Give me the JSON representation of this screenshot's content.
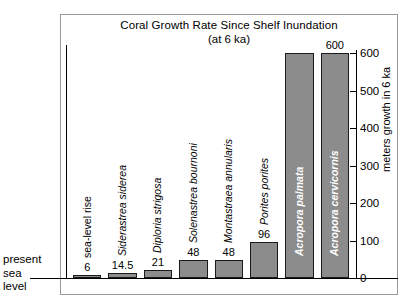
{
  "chart_data": {
    "type": "bar",
    "title": "Coral Growth Rate Since Shelf Inundation",
    "subtitle": "(at 6 ka)",
    "xlabel": "",
    "ylabel": "meters growth in 6 ka",
    "ylim": [
      0,
      600
    ],
    "yticks": [
      0,
      100,
      200,
      300,
      400,
      500,
      600
    ],
    "grid": false,
    "legend": null,
    "categories": [
      "sea-level rise",
      "Siderastrea siderea",
      "Diploria strigosa",
      "Solenastrea bournoni",
      "Montastraea annularis",
      "Porites porites",
      "Acropora palmata",
      "Acropora cervicornis"
    ],
    "values": [
      6,
      14.5,
      21,
      48,
      48,
      96,
      600,
      600
    ],
    "value_labels": [
      "6",
      "14.5",
      "21",
      "48",
      "48",
      "96",
      "",
      "600"
    ],
    "annotations": [
      "present sea level"
    ]
  },
  "chart": {
    "title": "Coral Growth Rate Since Shelf Inundation",
    "subtitle": "(at 6 ka)",
    "y_axis_title": "meters growth in 6 ka",
    "sea_level_annotation": "present\nsea\nlevel",
    "bar_fill_color": "#8c8c8c",
    "bar_stroke_color": "#1a1a1a",
    "frame_color": "#9a9a9a",
    "axis_color": "#000000",
    "inside_label_color": "#ffffff"
  },
  "bars": [
    {
      "label": "sea-level rise",
      "value": 6,
      "value_label": "6",
      "italic": false,
      "label_inside": false
    },
    {
      "label": "Siderastrea siderea",
      "value": 14.5,
      "value_label": "14.5",
      "italic": true,
      "label_inside": false
    },
    {
      "label": "Diploria strigosa",
      "value": 21,
      "value_label": "21",
      "italic": true,
      "label_inside": false
    },
    {
      "label": "Solenastrea bournoni",
      "value": 48,
      "value_label": "48",
      "italic": true,
      "label_inside": false
    },
    {
      "label": "Montastraea annularis",
      "value": 48,
      "value_label": "48",
      "italic": true,
      "label_inside": false
    },
    {
      "label": "Porites porites",
      "value": 96,
      "value_label": "96",
      "italic": true,
      "label_inside": false
    },
    {
      "label": "Acropora palmata",
      "value": 600,
      "value_label": "",
      "italic": true,
      "label_inside": true
    },
    {
      "label": "Acropora cervicornis",
      "value": 600,
      "value_label": "600",
      "italic": true,
      "label_inside": true
    }
  ],
  "yticks": [
    {
      "value": 600,
      "label": "600"
    },
    {
      "value": 500,
      "label": "500"
    },
    {
      "value": 400,
      "label": "400"
    },
    {
      "value": 300,
      "label": "300"
    },
    {
      "value": 200,
      "label": "200"
    },
    {
      "value": 100,
      "label": "100"
    },
    {
      "value": 0,
      "label": "0"
    }
  ]
}
